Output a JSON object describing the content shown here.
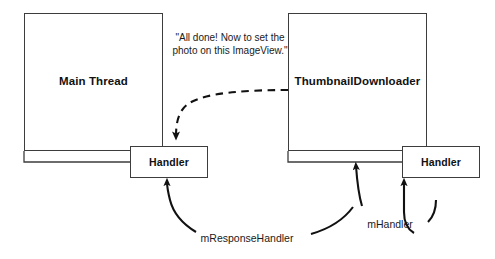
{
  "diagram": {
    "background_color": "#ffffff",
    "stroke_color": "#3d3d3d",
    "text_color": "#111111",
    "nodes": {
      "main_thread": {
        "label": "Main Thread"
      },
      "thumbnail_downloader": {
        "label": "ThumbnailDownloader"
      },
      "handler_main": {
        "label": "Handler"
      },
      "handler_downloader": {
        "label": "Handler"
      }
    },
    "callouts": {
      "message": "\"All done! Now to set the photo on this ImageView.\""
    },
    "edge_labels": {
      "response_handler": "mResponseHandler",
      "handler": "mHandler"
    }
  }
}
